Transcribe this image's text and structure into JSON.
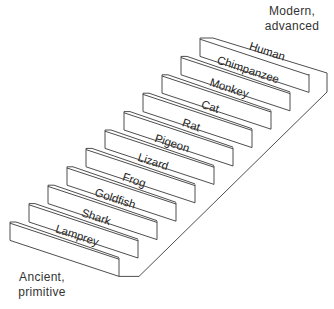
{
  "diagram": {
    "type": "staircase",
    "title_top": {
      "line1": "Modern,",
      "line2": "advanced"
    },
    "title_bottom": {
      "line1": "Ancient,",
      "line2": "primitive"
    },
    "steps_bottom_to_top": [
      "Lamprey",
      "Shark",
      "Goldfish",
      "Frog",
      "Lizard",
      "Pigeon",
      "Rat",
      "Cat",
      "Monkey",
      "Chimpanzee",
      "Human"
    ],
    "colors": {
      "line": "#3a3a3a",
      "text": "#222222",
      "background": "#ffffff"
    }
  }
}
